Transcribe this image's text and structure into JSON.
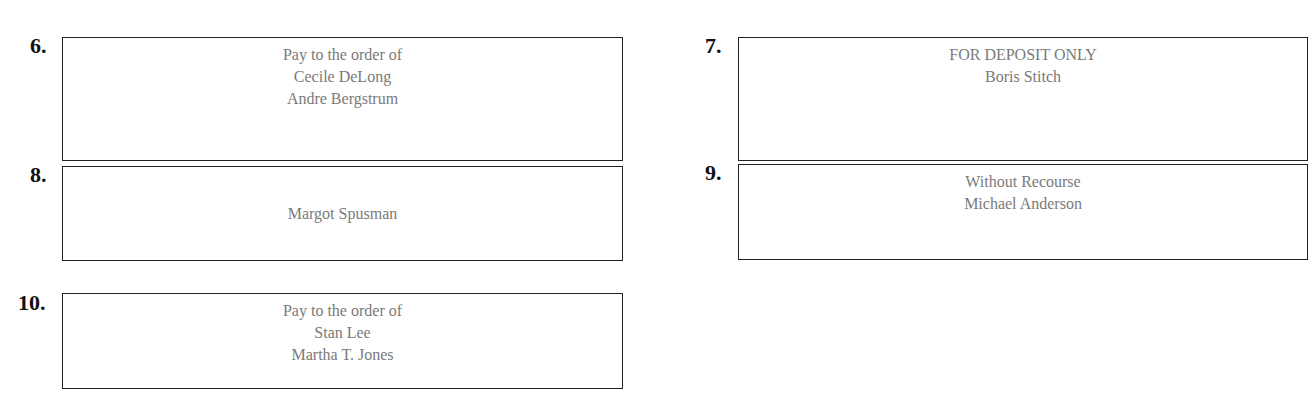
{
  "items": [
    {
      "number": "6.",
      "lines": [
        "Pay to the order of",
        "Cecile DeLong",
        "Andre Bergstrum"
      ]
    },
    {
      "number": "7.",
      "lines": [
        "FOR DEPOSIT ONLY",
        "Boris Stitch"
      ]
    },
    {
      "number": "8.",
      "lines": [
        "Margot Spusman"
      ]
    },
    {
      "number": "9.",
      "lines": [
        "Without Recourse",
        "Michael Anderson"
      ]
    },
    {
      "number": "10.",
      "lines": [
        "Pay to the order of",
        "Stan Lee",
        "Martha T. Jones"
      ]
    }
  ]
}
